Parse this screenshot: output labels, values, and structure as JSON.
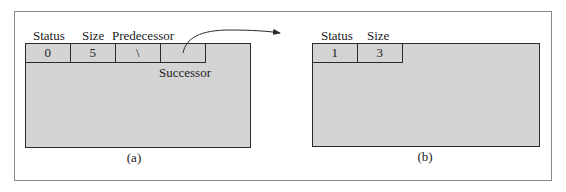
{
  "figure": {
    "panels": [
      {
        "caption": "(a)",
        "field_labels": [
          "Status",
          "Size",
          "Predecessor"
        ],
        "cells": [
          "0",
          "5",
          "\\",
          ""
        ],
        "successor_label": "Successor"
      },
      {
        "caption": "(b)",
        "field_labels": [
          "Status",
          "Size"
        ],
        "cells": [
          "1",
          "3"
        ]
      }
    ],
    "colors": {
      "block_fill": "#d4d4d4",
      "border": "#2a2a2a",
      "frame": "#8a8a8a"
    }
  }
}
